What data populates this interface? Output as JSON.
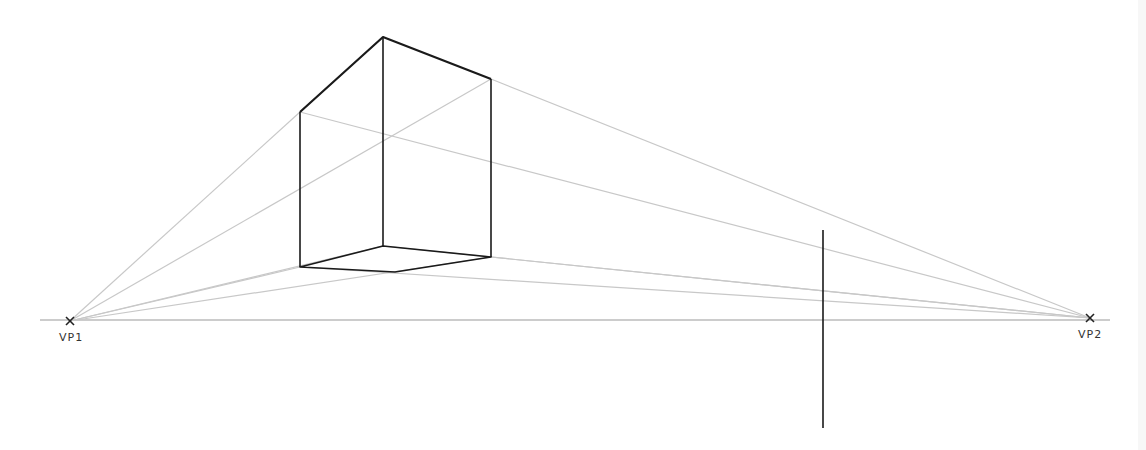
{
  "diagram": {
    "horizon": {
      "x1": 40,
      "x2": 1110,
      "y": 320
    },
    "vanishing_points": [
      {
        "id": "vp1",
        "label": "VP1",
        "x": 70,
        "y": 321,
        "marker": "x"
      },
      {
        "id": "vp2",
        "label": "VP2",
        "x": 1090,
        "y": 318,
        "marker": "x"
      }
    ],
    "box": {
      "vertices": {
        "top": [
          383,
          37
        ],
        "left_top": [
          300,
          112
        ],
        "right_top": [
          491,
          79
        ],
        "back_bottom": [
          383,
          246
        ],
        "left_bottom": [
          300,
          267
        ],
        "right_bottom": [
          491,
          257
        ],
        "front_bottom": [
          395,
          272
        ]
      }
    },
    "vertical_line": {
      "x": 823,
      "y1": 230,
      "y2": 428
    },
    "colors": {
      "edge": "#1a1a1a",
      "guide": "#c4c4c4",
      "horizon": "#888888"
    }
  }
}
